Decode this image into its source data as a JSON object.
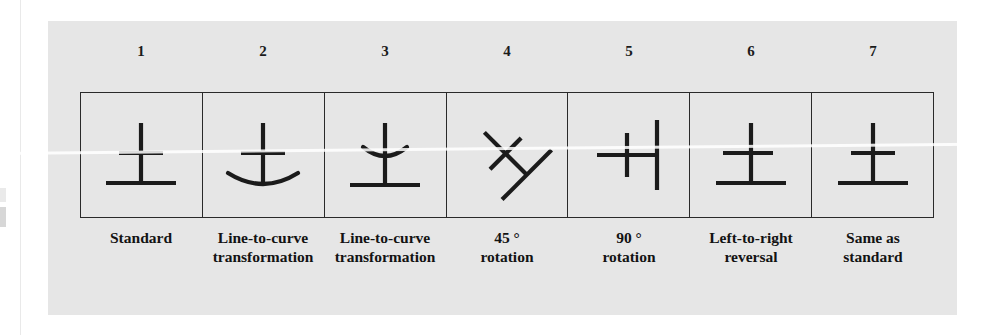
{
  "figure": {
    "panel_color": "#e6e6e6",
    "ink_color": "#1b1b1b",
    "columns": [
      {
        "number": "1",
        "caption": "Standard",
        "glyph": "standard",
        "description": "vertical stroke with straight middle crossbar and straight base line"
      },
      {
        "number": "2",
        "caption": "Line-to-curve\ntransformation",
        "glyph": "curved-base",
        "description": "base line transformed into an upward curve"
      },
      {
        "number": "3",
        "caption": "Line-to-curve\ntransformation",
        "glyph": "curved-crossbar",
        "description": "middle crossbar transformed into a downward curve"
      },
      {
        "number": "4",
        "caption": "45 °\nrotation",
        "glyph": "rotated-45",
        "description": "standard glyph rotated forty-five degrees"
      },
      {
        "number": "5",
        "caption": "90 °\nrotation",
        "glyph": "rotated-90",
        "description": "standard glyph rotated ninety degrees"
      },
      {
        "number": "6",
        "caption": "Left-to-right\nreversal",
        "glyph": "mirrored",
        "description": "standard glyph mirrored left to right"
      },
      {
        "number": "7",
        "caption": "Same as\nstandard",
        "glyph": "standard",
        "description": "identical to the standard glyph"
      }
    ]
  }
}
